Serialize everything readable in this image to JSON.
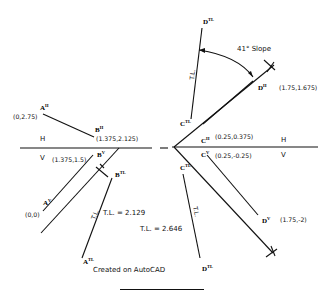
{
  "diagram": {
    "left": {
      "fold_line": {
        "upper": "H",
        "lower": "V"
      },
      "points": {
        "A_H": {
          "label": "A",
          "sup": "H",
          "coord": "(0,2.75)"
        },
        "B_H": {
          "label": "B",
          "sup": "H",
          "coord": "(1.375,2.125)"
        },
        "B_V": {
          "label": "B",
          "sup": "V",
          "coord": "(1.375,1.5)"
        },
        "A_V": {
          "label": "A",
          "sup": "V",
          "coord": "(0,0)"
        },
        "B_TL": {
          "label": "B",
          "sup": "TL"
        },
        "A_TL": {
          "label": "A",
          "sup": "TL"
        }
      },
      "true_length_tag": "T.L.",
      "true_length_value": "T.L. = 2.129"
    },
    "right": {
      "fold_line": {
        "upper": "H",
        "lower": "V"
      },
      "slope_annotation": "41° Slope",
      "points": {
        "D_TL_top": {
          "label": "D",
          "sup": "TL"
        },
        "C_TL_top": {
          "label": "C",
          "sup": "TL"
        },
        "D_H": {
          "label": "D",
          "sup": "H",
          "coord": "(1.75,1.675)"
        },
        "C_H": {
          "label": "C",
          "sup": "H",
          "coord": "(0.25,0.375)"
        },
        "C_V": {
          "label": "C",
          "sup": "V",
          "coord": "(0.25,-0.25)"
        },
        "C_TL_bottom": {
          "label": "C",
          "sup": "TL"
        },
        "D_V": {
          "label": "D",
          "sup": "V",
          "coord": "(1.75,-2)"
        },
        "D_TL_bottom": {
          "label": "D",
          "sup": "TL"
        }
      },
      "true_length_tag_top": "T.L.",
      "true_length_tag_bottom": "T.L.",
      "true_length_value": "T.L. = 2.646"
    },
    "footer": {
      "credit": "Created on AutoCAD"
    }
  }
}
